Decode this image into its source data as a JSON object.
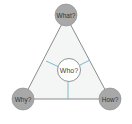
{
  "diagram": {
    "nodes": {
      "top": {
        "label": "What?"
      },
      "left": {
        "label": "Why?"
      },
      "right": {
        "label": "How?"
      },
      "center": {
        "label": "Who?"
      }
    },
    "colors": {
      "outer_node_fill": "#a8a8a8",
      "outer_node_stroke": "#8a8a8a",
      "triangle_fill": "#f4f6f6",
      "triangle_stroke": "#6e6e6e",
      "center_fill": "#ffffff",
      "center_stroke": "#777777",
      "spoke_color": "#6fb3c2"
    }
  }
}
